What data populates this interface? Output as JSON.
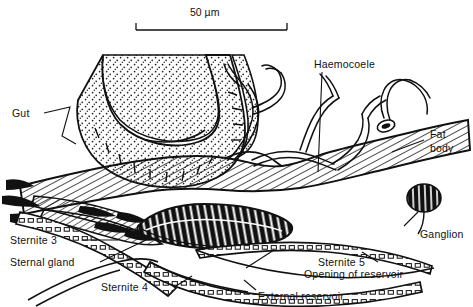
{
  "figure": {
    "type": "scientific-line-drawing",
    "scale_bar": {
      "label": "50 µm",
      "x_start_px": 136,
      "x_end_px": 287
    }
  },
  "labels": {
    "scale": "50 µm",
    "gut": "Gut",
    "haemocoele": "Haemocoele",
    "fat_body_line1": "Fat",
    "fat_body_line2": "body",
    "ganglion": "Ganglion",
    "sternite3": "Sternite 3",
    "sternal_gland": "Sternal gland",
    "sternite4": "Sternite 4",
    "sternite5": "Sternite 5",
    "opening_of_reservoir": "Opening of reservoir",
    "external_reservoir": "External reservoir"
  },
  "structures": [
    {
      "name": "gut",
      "texture": "stipple"
    },
    {
      "name": "fat-body",
      "texture": "diagonal-hatch"
    },
    {
      "name": "sternal-gland",
      "texture": "solid-black-with-white-striations"
    },
    {
      "name": "ganglion",
      "texture": "solid-black-with-white-striations"
    },
    {
      "name": "tracheae",
      "texture": "thin-double-line-branches"
    },
    {
      "name": "sternite-cuticle",
      "texture": "segmented-cell-band"
    },
    {
      "name": "apodeme",
      "texture": "solid-black-wedge"
    }
  ],
  "colors": {
    "ink": "#111111",
    "paper": "#ffffff"
  }
}
